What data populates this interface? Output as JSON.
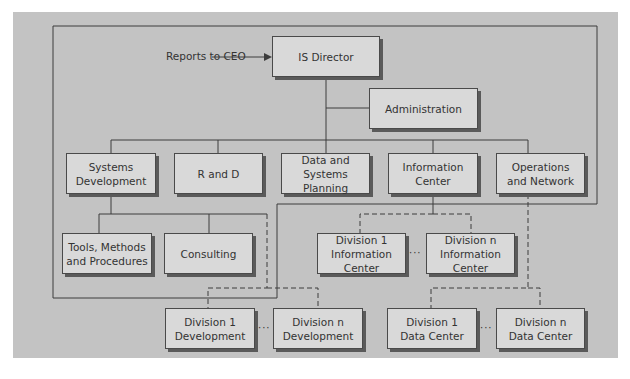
{
  "diagram": {
    "type": "org-chart",
    "annotation": "Reports to CEO",
    "top": {
      "label": "IS Director"
    },
    "staff": {
      "label": "Administration"
    },
    "departments": [
      {
        "label": "Systems\nDevelopment"
      },
      {
        "label": "R and D"
      },
      {
        "label": "Data and Systems\nPlanning"
      },
      {
        "label": "Information\nCenter"
      },
      {
        "label": "Operations\nand Network"
      }
    ],
    "sub_units": [
      {
        "label": "Tools, Methods\nand Procedures",
        "parent": "Systems Development"
      },
      {
        "label": "Consulting",
        "parent": "Systems Development"
      }
    ],
    "division_units": [
      {
        "label": "Division 1\nInformation Center",
        "parent": "Information Center"
      },
      {
        "label": "Division n\nInformation Center",
        "parent": "Information Center"
      },
      {
        "label": "Division 1\nDevelopment",
        "parent": "Systems Development"
      },
      {
        "label": "Division n\nDevelopment",
        "parent": "Systems Development"
      },
      {
        "label": "Division 1\nData Center",
        "parent": "Operations and Network"
      },
      {
        "label": "Division n\nData Center",
        "parent": "Operations and Network"
      }
    ],
    "ellipsis": "···"
  }
}
